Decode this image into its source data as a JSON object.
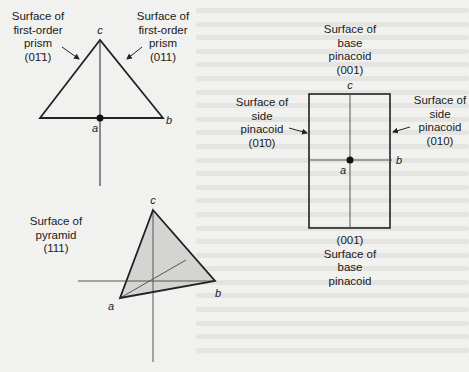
{
  "figure": {
    "prism_panel": {
      "left_label": [
        "Surface of",
        "first-order",
        "prism",
        "(01̄1)"
      ],
      "right_label": [
        "Surface of",
        "first-order",
        "prism",
        "(011)"
      ],
      "axes": {
        "c": "c",
        "a": "a",
        "b": "b"
      }
    },
    "pyramid_panel": {
      "label": [
        "Surface of",
        "pyramid",
        "(111)"
      ],
      "axes": {
        "c": "c",
        "a": "a",
        "b": "b"
      },
      "face_color": "#d4d4d2"
    },
    "pinacoid_panel": {
      "top_label": [
        "Surface of",
        "base",
        "pinacoid",
        "(001)"
      ],
      "left_label": [
        "Surface of",
        "side",
        "pinacoid",
        "(01̄0)"
      ],
      "right_label": [
        "Surface of",
        "side",
        "pinacoid",
        "(010)"
      ],
      "bottom_label": [
        "(001̄)",
        "Surface of",
        "base",
        "pinacoid"
      ],
      "axes": {
        "c": "c",
        "a": "a",
        "b": "b"
      }
    }
  }
}
